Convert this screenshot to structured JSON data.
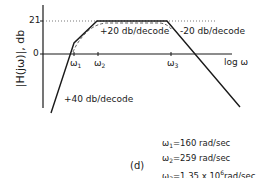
{
  "figure": {
    "caption": "(d)",
    "y_axis_label": "|H(jω)|, db",
    "x_axis_label": "log ω",
    "y_ticks": [
      "21",
      "0"
    ],
    "x_ticks": [
      "ω1",
      "ω2",
      "ω3"
    ],
    "slope_labels": {
      "rise_low": "+40 db/decode",
      "rise_mid": "+20 db/decode",
      "fall": "-20 db/decode"
    },
    "legend": [
      {
        "sym": "ω",
        "sub": "1",
        "text": "=160 rad/sec"
      },
      {
        "sym": "ω",
        "sub": "2",
        "text": "=259 rad/sec"
      },
      {
        "sym": "ω",
        "sub": "3",
        "text": "=1.35 x 10",
        "sup": "6",
        "text2": "rad/sec"
      }
    ]
  }
}
